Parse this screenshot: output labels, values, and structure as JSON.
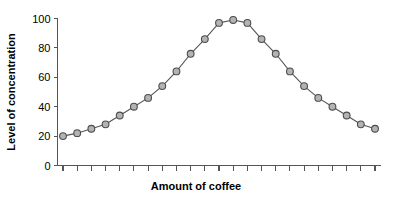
{
  "chart_data": {
    "type": "line",
    "title": "",
    "xlabel": "Amount of coffee",
    "ylabel": "Level of concentration",
    "ylim": [
      0,
      100
    ],
    "yticks": [
      0,
      20,
      40,
      60,
      80,
      100
    ],
    "ytick_labels": [
      "0",
      "20",
      "40",
      "60",
      "80",
      "100"
    ],
    "xticks_count": 23,
    "xtick_labels": [],
    "grid": false,
    "legend": false,
    "legend_position": "none",
    "marker": "circle",
    "marker_fill": "#b3b3b3",
    "marker_edge": "#4d4d4d",
    "line_color": "#555555",
    "axis_color": "#555555",
    "text_color": "#000000",
    "background": "#ffffff",
    "x": [
      1,
      2,
      3,
      4,
      5,
      6,
      7,
      8,
      9,
      10,
      11,
      12,
      13,
      14,
      15,
      16,
      17,
      18,
      19,
      20,
      21,
      22,
      23
    ],
    "values": [
      20,
      22,
      25,
      28,
      34,
      40,
      46,
      54,
      64,
      76,
      86,
      97,
      99,
      97,
      86,
      76,
      64,
      54,
      46,
      40,
      34,
      28,
      25
    ],
    "series": [
      {
        "name": "Level of concentration",
        "values": [
          20,
          22,
          25,
          28,
          34,
          40,
          46,
          54,
          64,
          76,
          86,
          97,
          99,
          97,
          86,
          76,
          64,
          54,
          46,
          40,
          34,
          28,
          25
        ]
      }
    ]
  }
}
